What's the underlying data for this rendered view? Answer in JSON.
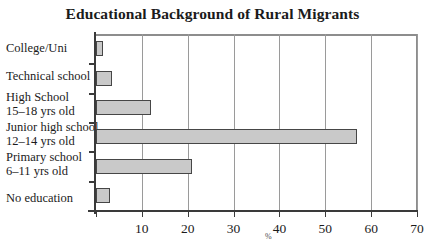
{
  "chart_data": {
    "type": "bar",
    "orientation": "horizontal",
    "title": "Educational Background of Rural Migrants",
    "xlabel": "%",
    "ylabel": "",
    "xlim": [
      0,
      70
    ],
    "xticks": [
      0,
      10,
      20,
      30,
      40,
      50,
      60,
      70
    ],
    "xtick_labels": [
      "",
      "10",
      "20",
      "30",
      "40",
      "50",
      "60",
      "70"
    ],
    "grid": true,
    "legend": false,
    "bar_fill_color": "#c9c9c9",
    "bar_edge_color": "#464646",
    "categories": [
      "College/Uni",
      "Technical school",
      "High School 15–18 yrs old",
      "Junior high school 12–14 yrs old",
      "Primary school 6–11 yrs old",
      "No education"
    ],
    "category_lines": [
      {
        "line1": "College/Uni",
        "line2": ""
      },
      {
        "line1": "Technical school",
        "line2": ""
      },
      {
        "line1": "High School",
        "line2": "15–18 yrs old"
      },
      {
        "line1": "Junior high school",
        "line2": "12–14 yrs old"
      },
      {
        "line1": "Primary school",
        "line2": "6–11 yrs old"
      },
      {
        "line1": "No education",
        "line2": ""
      }
    ],
    "values": [
      1.5,
      3.5,
      12,
      57,
      21,
      3
    ]
  }
}
